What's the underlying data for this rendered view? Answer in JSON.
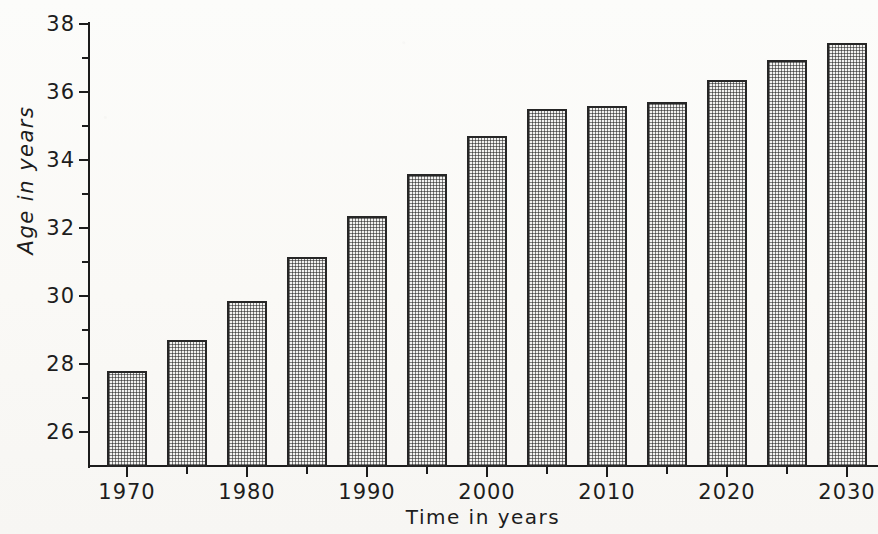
{
  "chart_data": {
    "type": "bar",
    "title": "",
    "xlabel": "Time in years",
    "ylabel": "Age in years",
    "categories": [
      "1970",
      "1975",
      "1980",
      "1985",
      "1990",
      "1995",
      "2000",
      "2005",
      "2010",
      "2015",
      "2020",
      "2025",
      "2030"
    ],
    "values": [
      27.8,
      28.7,
      29.85,
      31.15,
      32.35,
      33.6,
      34.7,
      35.5,
      35.6,
      35.7,
      36.35,
      36.95,
      37.45
    ],
    "x_tick_labels": [
      "1970",
      "1980",
      "1990",
      "2000",
      "2010",
      "2020",
      "2030"
    ],
    "x_minor_tick_categories": [
      "1975",
      "1985",
      "1995",
      "2005",
      "2015",
      "2025"
    ],
    "y_tick_labels": [
      "26",
      "28",
      "30",
      "32",
      "34",
      "36",
      "38"
    ],
    "y_minor_tick_values": [
      27,
      29,
      31,
      33,
      35,
      37
    ],
    "ylim": [
      25,
      38
    ],
    "xlim_categories": 13,
    "grid": false,
    "legend": false,
    "bar_fill": "cross-hatch-grid",
    "bar_edge_color": "#262626",
    "bar_face_color": "#f2f2f0",
    "axis_color": "#1c1c1c",
    "background_color": "#fbfbf9"
  },
  "axes": {
    "y_title": "Age  in  years",
    "x_title": "Time  in  years"
  }
}
